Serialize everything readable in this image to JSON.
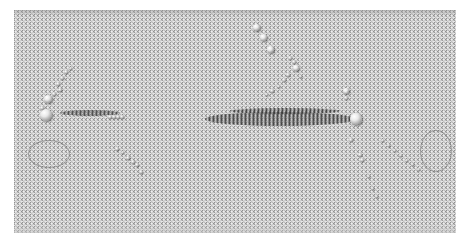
{
  "scene": {
    "description": "3D render of a dense grid of small spheres with larger spheres and bead chains",
    "grid": {
      "x": 14,
      "y": 10,
      "width": 442,
      "height": 223,
      "spacing": 4,
      "dot_color": "#9a9a9a",
      "background": "#e6e6e6"
    },
    "large_spheres": [
      {
        "id": "left-sphere",
        "x": 46,
        "y": 115,
        "d": 12
      },
      {
        "id": "left-sphere-small",
        "x": 48,
        "y": 99,
        "d": 8
      },
      {
        "id": "right-sphere",
        "x": 356,
        "y": 119,
        "d": 12
      },
      {
        "id": "top-chain-1",
        "x": 256,
        "y": 27,
        "d": 7
      },
      {
        "id": "top-chain-2",
        "x": 263,
        "y": 37,
        "d": 7
      },
      {
        "id": "top-chain-3",
        "x": 270,
        "y": 49,
        "d": 7
      },
      {
        "id": "top-chain-4",
        "x": 296,
        "y": 68,
        "d": 6
      },
      {
        "id": "right-upper",
        "x": 346,
        "y": 91,
        "d": 6
      }
    ],
    "beads": [
      {
        "x": 58,
        "y": 84,
        "d": 4
      },
      {
        "x": 62,
        "y": 78,
        "d": 4
      },
      {
        "x": 66,
        "y": 72,
        "d": 4
      },
      {
        "x": 60,
        "y": 90,
        "d": 4
      },
      {
        "x": 54,
        "y": 94,
        "d": 4
      },
      {
        "x": 42,
        "y": 108,
        "d": 4
      },
      {
        "x": 70,
        "y": 68,
        "d": 3
      },
      {
        "x": 110,
        "y": 117,
        "d": 4
      },
      {
        "x": 114,
        "y": 117,
        "d": 4
      },
      {
        "x": 118,
        "y": 117,
        "d": 4
      },
      {
        "x": 122,
        "y": 117,
        "d": 4
      },
      {
        "x": 117,
        "y": 149,
        "d": 4
      },
      {
        "x": 122,
        "y": 152,
        "d": 3
      },
      {
        "x": 128,
        "y": 158,
        "d": 4
      },
      {
        "x": 133,
        "y": 162,
        "d": 4
      },
      {
        "x": 137,
        "y": 165,
        "d": 4
      },
      {
        "x": 141,
        "y": 172,
        "d": 4
      },
      {
        "x": 290,
        "y": 58,
        "d": 4
      },
      {
        "x": 294,
        "y": 62,
        "d": 4
      },
      {
        "x": 288,
        "y": 75,
        "d": 4
      },
      {
        "x": 284,
        "y": 80,
        "d": 4
      },
      {
        "x": 278,
        "y": 86,
        "d": 3
      },
      {
        "x": 272,
        "y": 91,
        "d": 4
      },
      {
        "x": 266,
        "y": 94,
        "d": 3
      },
      {
        "x": 300,
        "y": 76,
        "d": 3
      },
      {
        "x": 346,
        "y": 98,
        "d": 4
      },
      {
        "x": 351,
        "y": 140,
        "d": 4
      },
      {
        "x": 360,
        "y": 155,
        "d": 4
      },
      {
        "x": 362,
        "y": 160,
        "d": 4
      },
      {
        "x": 368,
        "y": 176,
        "d": 3
      },
      {
        "x": 372,
        "y": 188,
        "d": 3
      },
      {
        "x": 376,
        "y": 196,
        "d": 3
      },
      {
        "x": 382,
        "y": 140,
        "d": 3
      },
      {
        "x": 388,
        "y": 145,
        "d": 3
      },
      {
        "x": 394,
        "y": 150,
        "d": 3
      },
      {
        "x": 400,
        "y": 155,
        "d": 3
      },
      {
        "x": 406,
        "y": 160,
        "d": 3
      },
      {
        "x": 412,
        "y": 164,
        "d": 3
      },
      {
        "x": 418,
        "y": 169,
        "d": 3
      }
    ],
    "streaks": [
      {
        "x": 205,
        "y": 112,
        "w": 150,
        "h": 14
      },
      {
        "x": 230,
        "y": 108,
        "w": 110,
        "h": 6
      },
      {
        "x": 60,
        "y": 110,
        "w": 60,
        "h": 6
      }
    ],
    "traces": [
      {
        "x": 28,
        "y": 140,
        "w": 40,
        "h": 26
      },
      {
        "x": 420,
        "y": 130,
        "w": 30,
        "h": 40
      }
    ]
  }
}
